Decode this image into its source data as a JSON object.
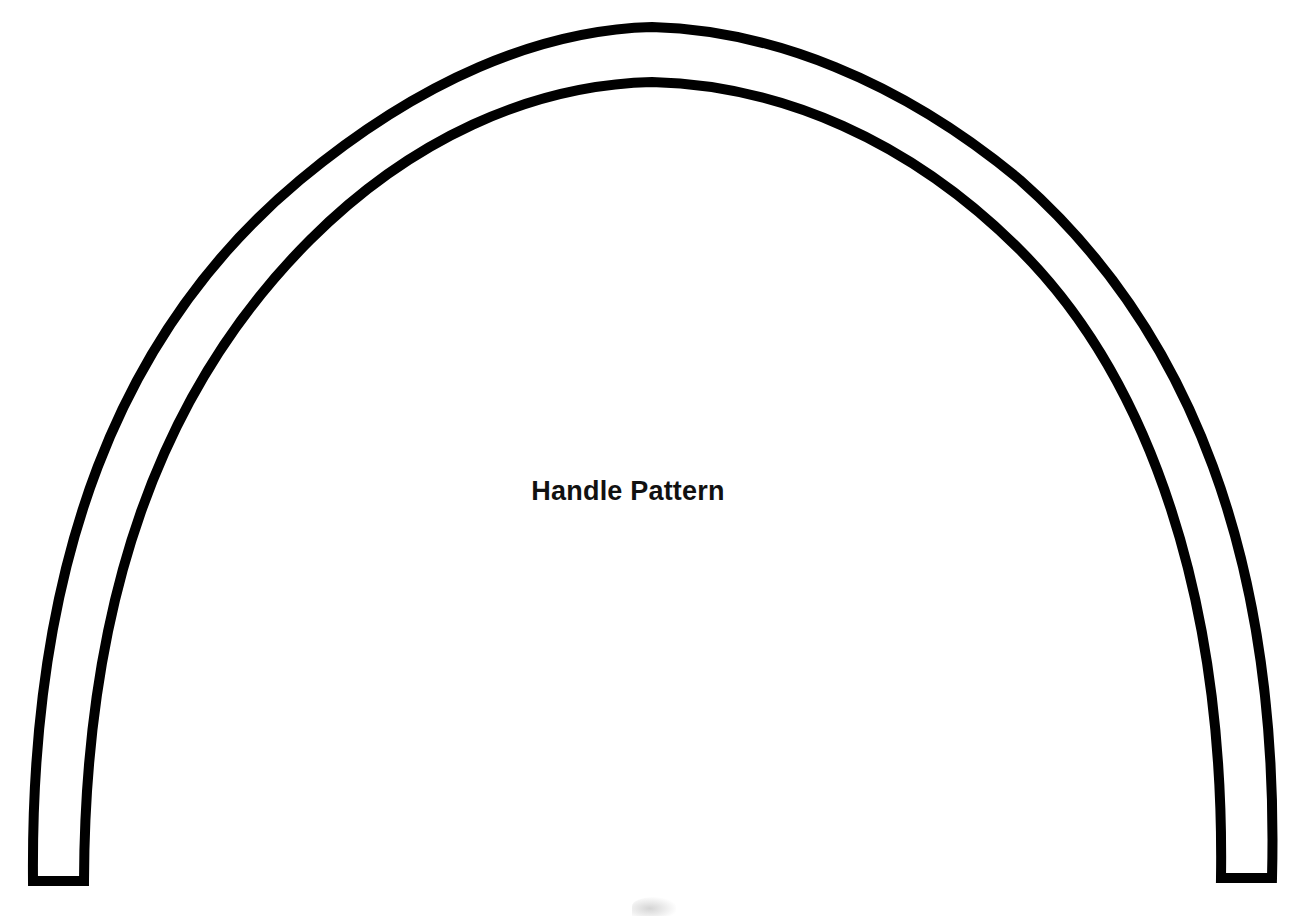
{
  "diagram": {
    "title": "Handle Pattern",
    "stroke_color": "#000000",
    "background_color": "#ffffff",
    "shape": "arch-handle-outline"
  }
}
